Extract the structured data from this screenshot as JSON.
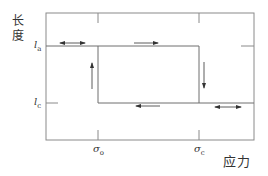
{
  "diagram": {
    "type": "stress-length hysteresis loop",
    "y_axis_label": "长度",
    "x_axis_label": "应力",
    "y_ticks": [
      {
        "symbol": "l",
        "subscript": "a",
        "position": "upper length"
      },
      {
        "symbol": "l",
        "subscript": "c",
        "position": "lower length"
      }
    ],
    "x_ticks": [
      {
        "symbol": "σ",
        "subscript": "o",
        "position": "left stress"
      },
      {
        "symbol": "σ",
        "subscript": "c",
        "position": "right stress"
      }
    ],
    "arrows": [
      {
        "location": "upper-left segment at l_a",
        "direction": "bidirectional"
      },
      {
        "location": "upper segment at l_a",
        "direction": "right"
      },
      {
        "location": "vertical at σ_c",
        "direction": "down"
      },
      {
        "location": "lower segment at l_c",
        "direction": "left"
      },
      {
        "location": "vertical at σ_o",
        "direction": "up"
      },
      {
        "location": "lower-right segment at l_c",
        "direction": "bidirectional"
      }
    ],
    "colors": {
      "frame": "#8a8a8a",
      "loop": "#6e6e6e",
      "arrow": "#333333",
      "text": "#333333"
    }
  }
}
